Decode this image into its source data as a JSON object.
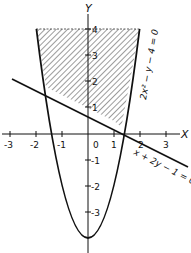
{
  "diagram": {
    "axes": {
      "x_label": "X",
      "y_label": "Y",
      "x_ticks": [
        "-3",
        "-2",
        "-1",
        "0",
        "1",
        "2",
        "3"
      ],
      "y_ticks": [
        "4",
        "3",
        "2",
        "1",
        "-1",
        "-2",
        "-3"
      ]
    },
    "curves": [
      {
        "name": "parabola",
        "equation": "2x² − y − 4 = 0"
      },
      {
        "name": "line",
        "equation": "x + 2y − 1 = 0"
      }
    ],
    "shaded_region": "region above line and inside parabola, up to y = 4",
    "colors": {
      "ink": "#111111",
      "background": "#ffffff"
    }
  }
}
